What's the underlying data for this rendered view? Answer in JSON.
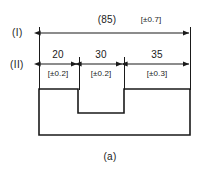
{
  "figure": {
    "caption": "(a)",
    "caption_x": 110,
    "caption_y": 152
  },
  "rows": [
    {
      "id": "row-1",
      "label": "(I)",
      "label_x": 12,
      "label_y": 28,
      "kind": "overall-reference",
      "dimensions": [
        {
          "id": "overall-85",
          "value": "(85)",
          "tolerance": "[±0.7]",
          "value_x": 107,
          "value_y": 15,
          "tol_x": 146,
          "tol_y": 16,
          "line_y": 33,
          "x_start": 39,
          "x_end": 190
        }
      ]
    },
    {
      "id": "row-2",
      "label": "(II)",
      "label_x": 10,
      "label_y": 60,
      "kind": "chain",
      "dimensions": [
        {
          "id": "seg-20",
          "value": "20",
          "tolerance": "[±0.2]",
          "value_x": 58,
          "value_y": 50,
          "tol_x": 58,
          "tol_y": 70,
          "line_y": 64,
          "x_start": 39,
          "x_end": 78
        },
        {
          "id": "seg-30",
          "value": "30",
          "tolerance": "[±0.2]",
          "value_x": 101,
          "value_y": 50,
          "tol_x": 101,
          "tol_y": 70,
          "line_y": 64,
          "x_start": 80,
          "x_end": 123
        },
        {
          "id": "seg-35",
          "value": "35",
          "tolerance": "[±0.3]",
          "value_x": 157,
          "value_y": 50,
          "tol_x": 157,
          "tol_y": 70,
          "line_y": 64,
          "x_start": 126,
          "x_end": 190
        }
      ]
    }
  ],
  "part_profile": {
    "id": "notched-block",
    "outline_points": "39,89 78,89 78,113 124,113 124,89 190,89 190,135 39,135 39,89",
    "left_x": 39,
    "right_x": 190,
    "top_y": 89,
    "bottom_y": 135,
    "notch_left_x": 78,
    "notch_right_x": 124,
    "notch_bottom_y": 113
  },
  "extension_lines": [
    {
      "id": "ext-left",
      "x": 39,
      "y_top": 27,
      "y_bottom": 89
    },
    {
      "id": "ext-notch-left",
      "x": 79,
      "y_top": 58,
      "y_bottom": 89
    },
    {
      "id": "ext-notch-right",
      "x": 124,
      "y_top": 58,
      "y_bottom": 89
    },
    {
      "id": "ext-right",
      "x": 190,
      "y_top": 27,
      "y_bottom": 89
    }
  ],
  "colors": {
    "ink": "#1a1a1a",
    "paper": "#ffffff"
  }
}
